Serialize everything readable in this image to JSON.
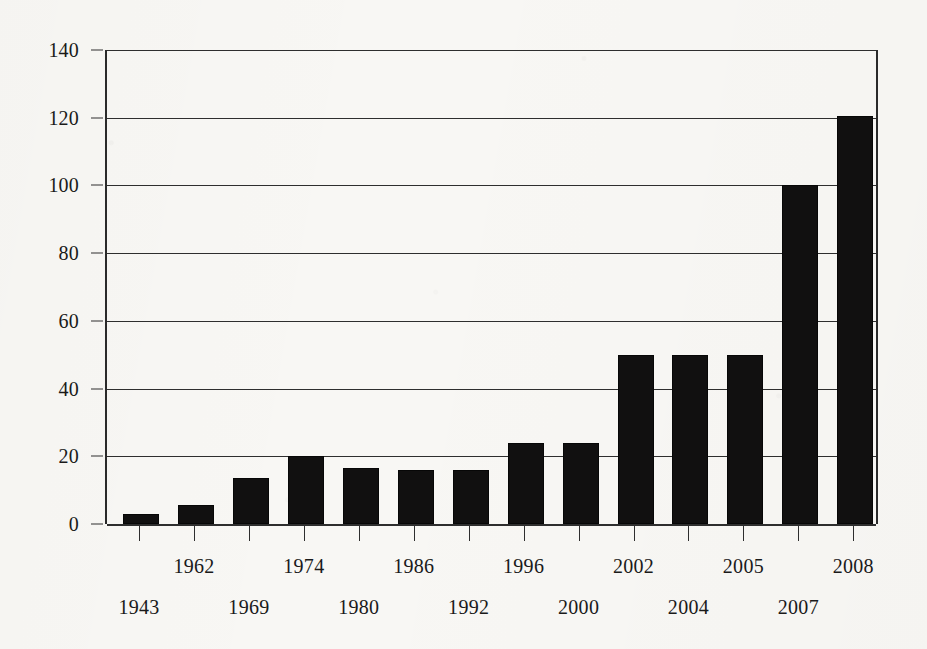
{
  "chart_data": {
    "type": "bar",
    "title": "",
    "subtitle": "",
    "xlabel": "",
    "ylabel": "",
    "categories": [
      "1943",
      "1962",
      "1969",
      "1974",
      "1980",
      "1986",
      "1992",
      "1996",
      "2000",
      "2002",
      "2004",
      "2005",
      "2007",
      "2008"
    ],
    "values": [
      3,
      5.5,
      13.5,
      20,
      16.5,
      16,
      16,
      24,
      24,
      50,
      50,
      50,
      100,
      120.5
    ],
    "series": [
      {
        "name": "count",
        "values": [
          3,
          5.5,
          13.5,
          20,
          16.5,
          16,
          16,
          24,
          24,
          50,
          50,
          50,
          100,
          120.5
        ]
      }
    ],
    "ylim": [
      0,
      140
    ],
    "yticks": [
      0,
      20,
      40,
      60,
      80,
      100,
      120,
      140
    ],
    "ytick_labels": [
      "0",
      "20",
      "40",
      "60",
      "80",
      "100",
      "120",
      "140"
    ],
    "grid": true,
    "grid_axis": "y",
    "legend": false,
    "legend_position": "none",
    "bar_color": "#111010",
    "axis_color": "#2e2e2e",
    "background_color": "#f8f7f4",
    "xtick_label_layout": "staggered-two-rows",
    "xtick_label_rows": {
      "upper": [
        "1962",
        "1974",
        "1986",
        "1996",
        "2002",
        "2005",
        "2008"
      ],
      "lower": [
        "1943",
        "1969",
        "1980",
        "1992",
        "2000",
        "2004",
        "2007"
      ]
    }
  }
}
